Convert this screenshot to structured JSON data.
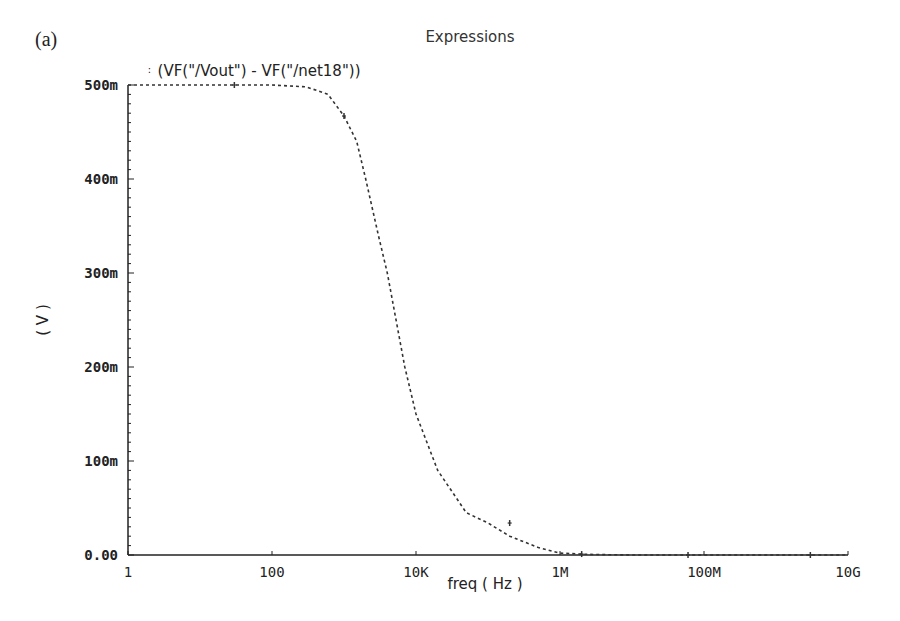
{
  "panel_label": "(a)",
  "title": "Expressions",
  "legend": {
    "marker": "∶",
    "expression": "(VF(\"/Vout\") - VF(\"/net18\"))"
  },
  "axes": {
    "xlabel": "freq ( Hz )",
    "ylabel": "( V )",
    "x_ticks": [
      "1",
      "100",
      "10K",
      "1M",
      "100M",
      "10G"
    ],
    "y_ticks": [
      "500m",
      "400m",
      "300m",
      "200m",
      "100m",
      "0.00"
    ]
  },
  "chart_data": {
    "type": "line",
    "title": "Expressions",
    "xlabel": "freq (Hz)",
    "ylabel": "(V)",
    "x_scale": "log",
    "xlim": [
      1,
      10000000000
    ],
    "ylim": [
      0,
      0.5
    ],
    "x_tick_labels": [
      "1",
      "100",
      "10K",
      "1M",
      "100M",
      "10G"
    ],
    "y_tick_labels": [
      "500m",
      "400m",
      "300m",
      "200m",
      "100m",
      "0.00"
    ],
    "grid": false,
    "legend_position": "top-left",
    "series": [
      {
        "name": "(VF(\"/Vout\") - VF(\"/net18\"))",
        "style": "dashed",
        "x": [
          1,
          10,
          30,
          100,
          300,
          600,
          1000,
          1500,
          2000,
          3000,
          4000,
          5000,
          7000,
          10000,
          20000,
          50000,
          100000,
          200000,
          500000,
          1000000,
          2000000,
          3000000,
          10000000,
          100000000,
          10000000000
        ],
        "y": [
          0.5,
          0.5,
          0.5,
          0.5,
          0.498,
          0.49,
          0.467,
          0.44,
          0.4,
          0.34,
          0.3,
          0.26,
          0.2,
          0.15,
          0.09,
          0.045,
          0.034,
          0.02,
          0.008,
          0.002,
          0.001,
          0.0005,
          0.0,
          0.0,
          0.0
        ]
      }
    ]
  }
}
